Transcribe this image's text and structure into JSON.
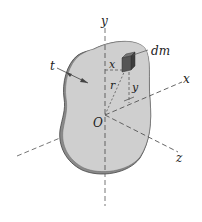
{
  "figure": {
    "labels": {
      "y_axis": "y",
      "x_axis": "x",
      "z_axis": "z",
      "origin": "O",
      "mass_element": "dm",
      "thickness": "t",
      "x_dist": "x",
      "y_dist": "y",
      "radius": "r"
    },
    "colors": {
      "plate_fill": "#cfcfcf",
      "plate_edge": "#555555",
      "element_fill": "#4a4a4a",
      "axis": "#555555"
    }
  }
}
